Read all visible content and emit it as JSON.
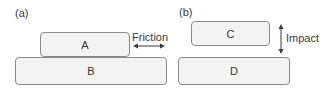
{
  "panels": {
    "a": {
      "label": "(a)",
      "top_block": {
        "label": "A"
      },
      "bottom_block": {
        "label": "B"
      },
      "annotation": {
        "label": "Friction",
        "arrow": "horizontal-double-arrow"
      }
    },
    "b": {
      "label": "(b)",
      "top_block": {
        "label": "C"
      },
      "bottom_block": {
        "label": "D"
      },
      "annotation": {
        "label": "Impact",
        "arrow": "vertical-double-arrow"
      }
    }
  },
  "colors": {
    "block_fill": "#f3f3f3",
    "block_border": "#8a8a8a",
    "text": "#3a3a3a",
    "arrow": "#3a3a3a"
  }
}
